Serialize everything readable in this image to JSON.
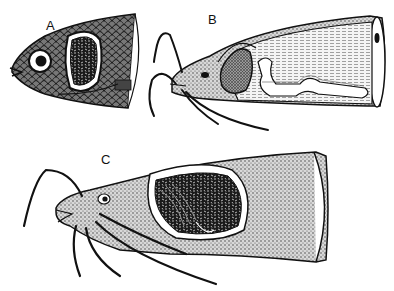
{
  "figure": {
    "panels": [
      {
        "label": "A",
        "subject": "fish head with scales, cutaway showing gill chamber organ"
      },
      {
        "label": "B",
        "subject": "catfish head with barbels, cutaway showing air sac extending along body"
      },
      {
        "label": "C",
        "subject": "catfish head with barbels, large cutaway showing labyrinth organ"
      }
    ],
    "colors": {
      "ink": "#111111",
      "paper": "#ffffff",
      "stipple": "#555555"
    }
  }
}
